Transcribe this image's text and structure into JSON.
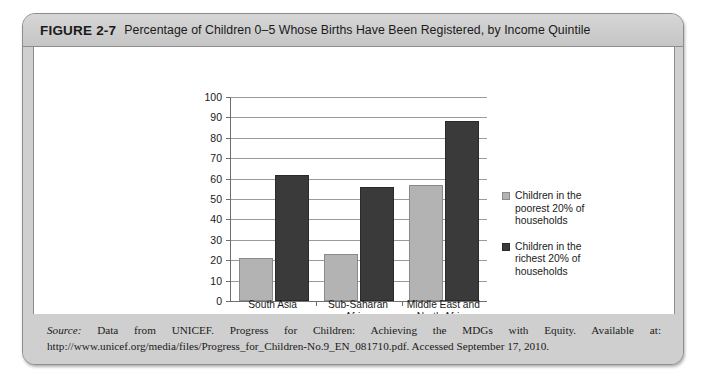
{
  "figure": {
    "label": "FIGURE 2-7",
    "title": "Percentage of Children 0–5 Whose Births Have Been Registered, by Income Quintile",
    "source_label": "Source:",
    "source_body": " Data from UNICEF. Progress for Children: Achieving the MDGs with Equity. Available at: http://www.unicef.org/media/files/Progress_for_Children-No.9_EN_081710.pdf. Accessed September 17, 2010."
  },
  "colors": {
    "poorest": "#b3b3b3",
    "richest": "#3a3a3a",
    "axis": "#6f6f6f",
    "grid": "#9a9a9a",
    "band": "#cfcfcf"
  },
  "chart_data": {
    "type": "bar",
    "title": "Percentage of Children 0–5 Whose Births Have Been Registered, by Income Quintile",
    "xlabel": "",
    "ylabel": "",
    "ylim": [
      0,
      100
    ],
    "yticks": [
      0,
      10,
      20,
      30,
      40,
      50,
      60,
      70,
      80,
      90,
      100
    ],
    "ytick_labels": [
      "0",
      "10",
      "20",
      "30",
      "40",
      "50",
      "60",
      "70",
      "80",
      "90",
      "100"
    ],
    "grid": true,
    "legend_position": "right",
    "categories": [
      "South Asia",
      "Sub-Saharan\nAfrica",
      "Middle East and\nNorth Africa"
    ],
    "series": [
      {
        "name": "Children in the poorest 20% of households",
        "color": "#b3b3b3",
        "values": [
          21,
          23,
          57
        ]
      },
      {
        "name": "Children in the richest 20% of households",
        "color": "#3a3a3a",
        "values": [
          62,
          56,
          88
        ]
      }
    ]
  }
}
